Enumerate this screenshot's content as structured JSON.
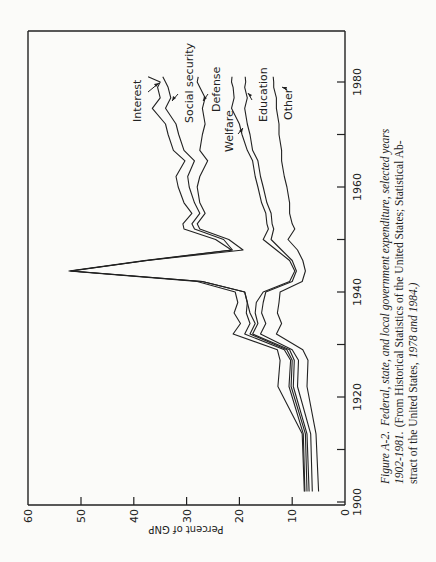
{
  "chart_data": {
    "type": "line",
    "orientation": "rotated 90° clockwise on page (years run bottom-to-top along right edge, percent runs right-to-left along bottom)",
    "title": "Federal, state, and local government expenditure, selected years 1902-1981",
    "figure_label": "Figure A-2.",
    "xlabel": "",
    "ylabel": "Percent of GNP",
    "xlim": [
      1900,
      1990
    ],
    "ylim": [
      0,
      60
    ],
    "x_ticks": [
      1900,
      1910,
      1920,
      1930,
      1940,
      1950,
      1960,
      1970,
      1980
    ],
    "x_tick_labels": [
      "1900",
      "1920",
      "1940",
      "1960",
      "1980"
    ],
    "y_ticks": [
      0,
      10,
      20,
      30,
      40,
      50,
      60
    ],
    "y_tick_labels": [
      "0",
      "10",
      "20",
      "30",
      "40",
      "50",
      "60"
    ],
    "grid": false,
    "stacked": true,
    "x": [
      1902,
      1913,
      1922,
      1927,
      1929,
      1932,
      1934,
      1936,
      1938,
      1940,
      1942,
      1944,
      1946,
      1948,
      1950,
      1952,
      1953,
      1955,
      1957,
      1960,
      1962,
      1965,
      1967,
      1970,
      1972,
      1975,
      1977,
      1979,
      1980,
      1981
    ],
    "series": [
      {
        "name": "Interest",
        "values": [
          7.7,
          8.1,
          12.7,
          12.3,
          12.8,
          21.2,
          19.8,
          21.0,
          20.3,
          20.8,
          28.0,
          52.3,
          38.0,
          21.5,
          24.5,
          30.5,
          30.7,
          29.0,
          30.5,
          31.6,
          32.0,
          30.3,
          32.5,
          33.5,
          34.0,
          36.5,
          35.0,
          35.5,
          35.0,
          37.3
        ]
      },
      {
        "name": "Social security",
        "values": [
          7.6,
          7.9,
          10.6,
          10.3,
          11.5,
          19.0,
          18.0,
          18.7,
          18.5,
          19.0,
          27.0,
          52.0,
          37.5,
          21.3,
          23.0,
          28.5,
          29.0,
          27.5,
          28.5,
          29.5,
          29.8,
          28.5,
          30.5,
          31.5,
          32.0,
          34.0,
          33.0,
          33.5,
          34.0,
          34.5
        ]
      },
      {
        "name": "Defense",
        "values": [
          7.2,
          7.5,
          10.2,
          10.0,
          11.0,
          18.0,
          17.0,
          18.0,
          18.5,
          19.0,
          27.0,
          51.8,
          37.5,
          19.3,
          22.0,
          27.5,
          28.0,
          26.5,
          27.5,
          28.0,
          27.5,
          26.0,
          27.5,
          27.0,
          26.5,
          27.0,
          26.5,
          27.5,
          28.0,
          27.8
        ]
      },
      {
        "name": "Welfare",
        "values": [
          6.8,
          7.2,
          9.8,
          9.6,
          10.5,
          17.5,
          16.5,
          17.0,
          16.8,
          15.5,
          10.5,
          9.5,
          10.5,
          13.0,
          15.5,
          14.5,
          14.8,
          15.0,
          15.8,
          16.5,
          17.0,
          17.5,
          18.5,
          19.5,
          20.0,
          21.5,
          21.0,
          21.2,
          21.5,
          21.4
        ]
      },
      {
        "name": "Education",
        "values": [
          6.2,
          6.5,
          9.0,
          8.8,
          10.0,
          16.0,
          15.0,
          15.8,
          15.5,
          15.0,
          10.0,
          9.2,
          10.0,
          12.0,
          14.0,
          13.5,
          13.8,
          14.0,
          14.8,
          15.5,
          16.0,
          16.5,
          17.5,
          18.0,
          18.5,
          19.0,
          18.5,
          19.0,
          18.8,
          18.9
        ]
      },
      {
        "name": "Other",
        "values": [
          5.0,
          5.5,
          7.2,
          7.0,
          8.0,
          13.0,
          12.0,
          12.8,
          12.5,
          12.3,
          8.1,
          7.5,
          8.0,
          9.0,
          10.8,
          9.5,
          10.0,
          10.5,
          10.5,
          11.0,
          11.5,
          12.0,
          12.0,
          12.5,
          12.5,
          13.0,
          13.0,
          13.5,
          13.5,
          13.6
        ]
      }
    ],
    "series_labels": [
      {
        "name": "Interest",
        "label_pos": "top-left, arrow to curve near 1979"
      },
      {
        "name": "Social security",
        "label_pos": "arrow to curve near 1976"
      },
      {
        "name": "Defense",
        "label_pos": "arrow to curve near 1976"
      },
      {
        "name": "Welfare",
        "label_pos": "arrow to curve near 1969"
      },
      {
        "name": "Education",
        "label_pos": "arrow to curve near 1976"
      },
      {
        "name": "Other",
        "label_pos": "arrow to curve near 1978"
      }
    ],
    "caption": {
      "label": "Figure A-2.",
      "title_italic": "Federal, state, and local government expenditure, selected years 1902-1981.",
      "source": "(From Historical Statistics of the United States; Statistical Abstract of the United States, 1978 and 1984.)"
    }
  },
  "axis": {
    "ylabel": "Percent of GNP",
    "year_labels": [
      "1900",
      "1920",
      "1940",
      "1960",
      "1980"
    ],
    "pct_labels": [
      "60",
      "50",
      "40",
      "30",
      "20",
      "10",
      "0"
    ]
  },
  "labels": {
    "interest": "Interest",
    "social_security": "Social security",
    "defense": "Defense",
    "welfare": "Welfare",
    "education": "Education",
    "other": "Other"
  },
  "caption": {
    "line1_label": "Figure A-2.",
    "line1_rest": "Federal, state, and local government expenditure, selected years",
    "line2_italic": "1902-1981.",
    "line2_rest": "(From Historical Statistics of the United States; Statistical Ab-",
    "line3_a": "stract of the United States,",
    "line3_italic": "1978 and 1984.)"
  }
}
